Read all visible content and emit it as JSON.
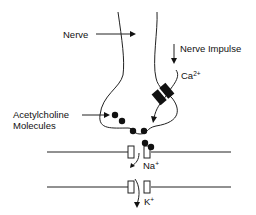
{
  "labels": {
    "nerve": "Nerve",
    "nerve_impulse": "Nerve Impulse",
    "calcium": "Ca",
    "calcium_charge": "2+",
    "acetylcholine_line1": "Acetylcholine",
    "acetylcholine_line2": "Molecules",
    "sodium": "Na",
    "sodium_charge": "+",
    "potassium": "K",
    "potassium_charge": "+"
  },
  "colors": {
    "stroke": "#222222",
    "fill": "#111111",
    "background": "#ffffff"
  }
}
